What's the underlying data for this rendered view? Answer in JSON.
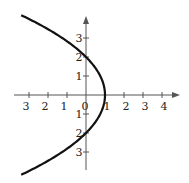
{
  "chart_data": {
    "type": "line",
    "title": "",
    "xlabel": "",
    "ylabel": "",
    "equation_implied": "x = 1 - y^2/4",
    "series": [
      {
        "name": "parabola",
        "points": [
          {
            "x": -2.8,
            "y": 4.2
          },
          {
            "x": -1.25,
            "y": 3
          },
          {
            "x": 0,
            "y": 2
          },
          {
            "x": 0.75,
            "y": 1
          },
          {
            "x": 1,
            "y": 0
          },
          {
            "x": 0.75,
            "y": -1
          },
          {
            "x": 0,
            "y": -2
          },
          {
            "x": -1.25,
            "y": -3
          },
          {
            "x": -2.8,
            "y": -4.2
          }
        ]
      }
    ],
    "x_ticks": [
      "3",
      "2",
      "1",
      "0",
      "1",
      "2",
      "3",
      "4"
    ],
    "x_tick_values": [
      -3,
      -2,
      -1,
      0,
      1,
      2,
      3,
      4
    ],
    "y_ticks": [
      "3",
      "2",
      "1",
      "1",
      "2",
      "3"
    ],
    "y_tick_values": [
      3,
      2,
      1,
      -1,
      -2,
      -3
    ],
    "xlim": [
      -3.7,
      4.8
    ],
    "ylim": [
      -3.9,
      4.2
    ],
    "grid": false,
    "legend": null
  },
  "colors": {
    "axis": "#555555",
    "curve": "#111111"
  }
}
